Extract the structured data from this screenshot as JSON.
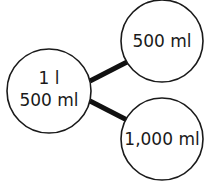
{
  "diagram": {
    "type": "part-whole",
    "whole": {
      "line1": "1 l",
      "line2": "500 ml"
    },
    "parts": [
      {
        "label": "500 ml"
      },
      {
        "label": "1,000 ml"
      }
    ],
    "colors": {
      "stroke": "#1a1a1a",
      "fill": "#ffffff",
      "connector": "#111111"
    }
  }
}
